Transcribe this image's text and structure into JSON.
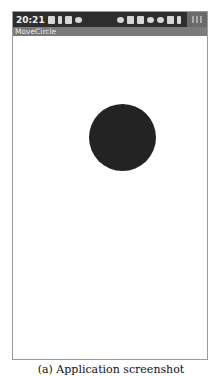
{
  "statusbar": {
    "time": "20:21",
    "left_icons": [
      "sim-icon",
      "signal-icon",
      "data-icon",
      "wifi-icon"
    ],
    "right_icons": [
      "cloud-icon",
      "image-icon",
      "image-icon",
      "cloud-icon",
      "shield-icon",
      "android-icon",
      "usb-icon"
    ]
  },
  "app": {
    "title": "MoveCircle"
  },
  "canvas": {
    "circle_color": "#232323"
  },
  "caption": "(a) Application screenshot"
}
